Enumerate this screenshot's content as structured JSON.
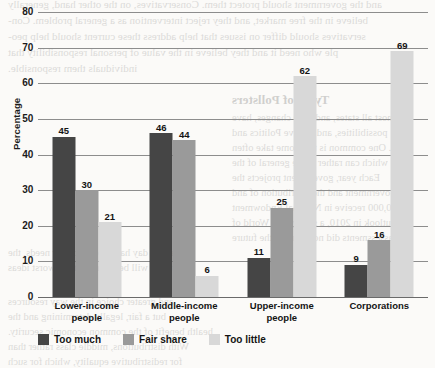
{
  "chart_data": {
    "type": "bar",
    "title": "",
    "xlabel": "",
    "ylabel": "Percentage",
    "ylim": [
      0,
      80
    ],
    "ytick_step": 10,
    "yticks": [
      0,
      10,
      20,
      30,
      40,
      50,
      60,
      70,
      80
    ],
    "grid": true,
    "legend_position": "bottom-left",
    "categories": [
      "Lower-income people",
      "Middle-income people",
      "Upper-income people",
      "Corporations"
    ],
    "category_lines": [
      [
        "Lower-income",
        "people"
      ],
      [
        "Middle-income",
        "people"
      ],
      [
        "Upper-income",
        "people"
      ],
      [
        "Corporations"
      ]
    ],
    "series": [
      {
        "name": "Too much",
        "color": "#454545",
        "values": [
          45,
          46,
          11,
          9
        ]
      },
      {
        "name": "Fair share",
        "color": "#9a9a9a",
        "values": [
          30,
          44,
          25,
          16
        ]
      },
      {
        "name": "Too little",
        "color": "#d8d8d8",
        "values": [
          21,
          6,
          62,
          69
        ]
      }
    ]
  },
  "background_text": {
    "lines": [
      "and the government should protect them. Conservatives, on the other hand, generally",
      "believe in the free market, and they reject intervention as a general problem. Con-",
      "servatives should differ on issues that help address these current should help peo-",
      "ple who need it and they believe in the value of personal responsibility that",
      "individuals them responsible."
    ],
    "heading": "Types of Pollsters",
    "block_lines": [
      "Almost all states, and state changes, have",
      "possibilities, and believe Politics and",
      "lives. One common is that some take often",
      "which can rather at the general of the",
      "Each year, government projects the",
      "Government and the distribution of and",
      "$20,000 receive in National Endowment",
      "Outlook in 2010, a survey, the World of",
      "assessments did not identify the future",
      "every day has his own of our needs, the",
      "those will be found that the worst ideas",
      "and greater choice in the way resources",
      "but a fair, legally determining and the",
      "health benefit of the common economic security.",
      "With distributions, middle class rather than",
      "for redistributive equality, which for such",
      "received benefit, or whether it needs"
    ]
  }
}
